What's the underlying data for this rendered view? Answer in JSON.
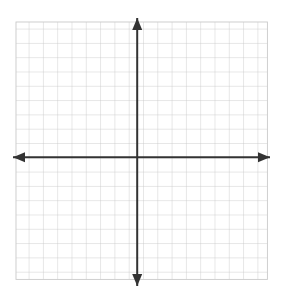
{
  "figure": {
    "kind": "cartesian-coordinate-plane",
    "width": 282,
    "height": 297,
    "background_color": "#ffffff",
    "title": "",
    "caption": ""
  },
  "grid": {
    "line_color": "#c9c9c9",
    "line_width": 0.9,
    "cell_size": 14.3,
    "left": 16,
    "top": 22,
    "right": 267.4,
    "bottom": 279.4,
    "columns": 18,
    "rows": 18,
    "visible": true
  },
  "axes": {
    "color": "#333333",
    "line_width": 2,
    "arrowheads": true,
    "origin_x": 137.2,
    "origin_y": 157.3,
    "x_axis": {
      "name": "x-axis",
      "label": "",
      "start_x": 13,
      "end_x": 270,
      "y": 157.3,
      "left_arrow": true,
      "right_arrow": true
    },
    "y_axis": {
      "name": "y-axis",
      "label": "",
      "x": 137.2,
      "start_y": 18,
      "end_y": 286,
      "up_arrow": true,
      "down_arrow": true
    }
  },
  "ticks": {
    "x_labels": [],
    "y_labels": [],
    "show_numbers": false
  },
  "chart_data": {
    "type": "scatter",
    "title": "",
    "subtitle": "",
    "xlabel": "",
    "ylabel": "",
    "grid": true,
    "legend": [],
    "annotations": [],
    "series": [],
    "x": [],
    "values": [],
    "xlim": [
      -8.5,
      9.1
    ],
    "ylim": [
      -8.5,
      9.5
    ],
    "xtick_step": 1,
    "ytick_step": 1,
    "note": "Blank Cartesian coordinate plane: no data points, curves, or tick labels are plotted."
  }
}
